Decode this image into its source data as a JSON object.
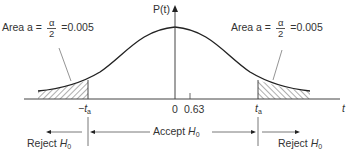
{
  "diagram": {
    "type": "t-distribution two-tailed hypothesis test",
    "y_axis_label": "P(t)",
    "x_axis_label": "t",
    "tick_labels": {
      "origin": "0",
      "observed": "0.63",
      "left_critical_prefix": "−t",
      "right_critical": "t",
      "critical_subscript": "a"
    },
    "annotations": {
      "left_area": {
        "prefix": "Area a =",
        "numerator": "α",
        "denominator": "2",
        "value": "=0.005"
      },
      "right_area": {
        "prefix": "Area a =",
        "numerator": "α",
        "denominator": "2",
        "value": "=0.005"
      }
    },
    "regions": {
      "reject_left": {
        "label": "Reject H",
        "subscript": "0"
      },
      "accept": {
        "label": "Accept H",
        "subscript": "0"
      },
      "reject_right": {
        "label": "Reject H",
        "subscript": "0"
      }
    }
  }
}
